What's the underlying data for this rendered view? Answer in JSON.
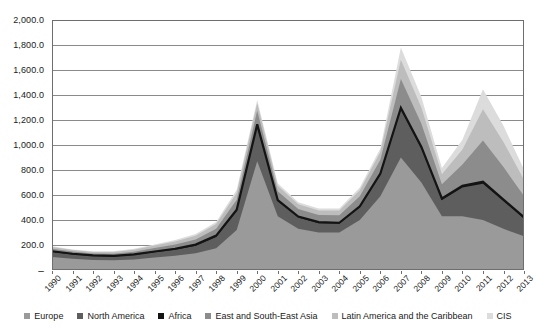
{
  "chart_data": {
    "type": "area",
    "stacked": true,
    "title": "",
    "subtitle": "",
    "xlabel": "",
    "ylabel": "",
    "grid": true,
    "legend_position": "bottom",
    "ylim": [
      0,
      2000
    ],
    "ytick_labels": [
      "2,000.0",
      "1,800.0",
      "1,600.0",
      "1,400.0",
      "1,200.0",
      "1,000.0",
      "800.0",
      "600.0",
      "400.0",
      "200.0",
      "–"
    ],
    "ytick_values": [
      2000,
      1800,
      1600,
      1400,
      1200,
      1000,
      800,
      600,
      400,
      200,
      0
    ],
    "categories": [
      "1990",
      "1991",
      "1992",
      "1993",
      "1994",
      "1995",
      "1996",
      "1997",
      "1998",
      "1999",
      "2000",
      "2001",
      "2002",
      "2003",
      "2004",
      "2005",
      "2006",
      "2007",
      "2008",
      "2009",
      "2010",
      "2011",
      "2012",
      "2013"
    ],
    "series": [
      {
        "name": "Europe",
        "color": "#9a9a9a",
        "values": [
          105,
          90,
          80,
          78,
          85,
          100,
          115,
          135,
          175,
          320,
          870,
          430,
          330,
          300,
          300,
          400,
          590,
          900,
          700,
          430,
          430,
          400,
          330,
          270
        ]
      },
      {
        "name": "North America",
        "color": "#5e5e5e",
        "values": [
          40,
          35,
          32,
          30,
          35,
          42,
          48,
          60,
          90,
          150,
          280,
          120,
          90,
          75,
          70,
          100,
          170,
          380,
          270,
          130,
          230,
          290,
          220,
          140
        ]
      },
      {
        "name": "Africa",
        "color": "#141414",
        "values": [
          5,
          5,
          5,
          5,
          5,
          6,
          7,
          8,
          10,
          12,
          15,
          10,
          8,
          8,
          8,
          10,
          12,
          18,
          15,
          12,
          14,
          16,
          14,
          12
        ]
      },
      {
        "name": "East and South-East Asia",
        "color": "#8c8c8c",
        "values": [
          20,
          18,
          16,
          18,
          22,
          28,
          35,
          42,
          55,
          80,
          110,
          70,
          60,
          58,
          60,
          80,
          110,
          230,
          185,
          115,
          170,
          330,
          260,
          170
        ]
      },
      {
        "name": "Latin America and the Caribbean",
        "color": "#bdbdbd",
        "values": [
          14,
          12,
          12,
          13,
          16,
          20,
          24,
          30,
          38,
          55,
          60,
          45,
          38,
          36,
          38,
          48,
          62,
          155,
          130,
          80,
          120,
          250,
          200,
          130
        ]
      },
      {
        "name": "CIS",
        "color": "#dcdcdc",
        "values": [
          6,
          5,
          5,
          6,
          7,
          9,
          11,
          13,
          17,
          25,
          25,
          20,
          17,
          16,
          17,
          22,
          28,
          97,
          85,
          50,
          78,
          160,
          130,
          82
        ]
      }
    ],
    "totals": [
      190,
      165,
      150,
      150,
      170,
      205,
      240,
      288,
      385,
      642,
      1360,
      695,
      543,
      493,
      493,
      660,
      972,
      1780,
      1385,
      817,
      1042,
      1446,
      1154,
      804
    ]
  },
  "legend": {
    "items": [
      {
        "label": "Europe",
        "color": "#9a9a9a"
      },
      {
        "label": "North America",
        "color": "#5e5e5e"
      },
      {
        "label": "Africa",
        "color": "#141414"
      },
      {
        "label": "East and South-East Asia",
        "color": "#8c8c8c"
      },
      {
        "label": "Latin America and the Caribbean",
        "color": "#bdbdbd"
      },
      {
        "label": "CIS",
        "color": "#dcdcdc"
      }
    ]
  },
  "axis_colors": {
    "frame": "#6e6e6e",
    "grid": "#8a8a8a",
    "text": "#1a1a1a"
  }
}
